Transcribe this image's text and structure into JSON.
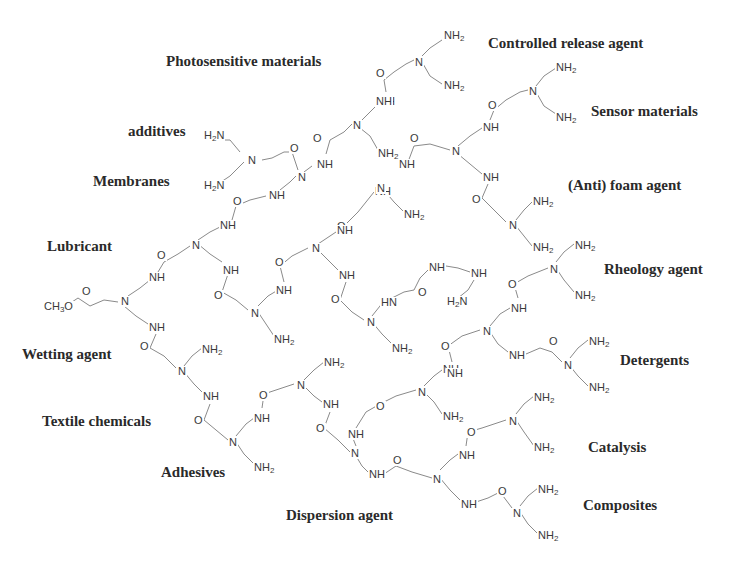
{
  "figure": {
    "type": "dendrimer-structure-diagram",
    "core_group": "CH3O",
    "applications": [
      {
        "id": "photosensitive",
        "label": "Photosensitive materials",
        "x": 166,
        "y": 54
      },
      {
        "id": "controlled-release",
        "label": "Controlled release agent",
        "x": 488,
        "y": 36
      },
      {
        "id": "additives",
        "label": "additives",
        "x": 128,
        "y": 124
      },
      {
        "id": "sensor",
        "label": "Sensor materials",
        "x": 591,
        "y": 104
      },
      {
        "id": "membranes",
        "label": "Membranes",
        "x": 93,
        "y": 174
      },
      {
        "id": "anti-foam",
        "label": "(Anti) foam agent",
        "x": 568,
        "y": 178
      },
      {
        "id": "lubricant",
        "label": "Lubricant",
        "x": 47,
        "y": 239
      },
      {
        "id": "rheology",
        "label": "Rheology agent",
        "x": 604,
        "y": 262
      },
      {
        "id": "wetting",
        "label": "Wetting agent",
        "x": 22,
        "y": 347
      },
      {
        "id": "detergents",
        "label": "Detergents",
        "x": 620,
        "y": 353
      },
      {
        "id": "textile",
        "label": "Textile chemicals",
        "x": 42,
        "y": 414
      },
      {
        "id": "catalysis",
        "label": "Catalysis",
        "x": 588,
        "y": 440
      },
      {
        "id": "adhesives",
        "label": "Adhesives",
        "x": 161,
        "y": 465
      },
      {
        "id": "composites",
        "label": "Composites",
        "x": 583,
        "y": 498
      },
      {
        "id": "dispersion",
        "label": "Dispersion agent",
        "x": 286,
        "y": 508
      }
    ],
    "atoms": [
      {
        "t": "CH3O",
        "x": 43,
        "y": 301
      },
      {
        "t": "O",
        "x": 81,
        "y": 286
      },
      {
        "t": "N",
        "x": 120,
        "y": 296
      },
      {
        "t": "NH",
        "x": 148,
        "y": 272
      },
      {
        "t": "O",
        "x": 156,
        "y": 250
      },
      {
        "t": "N",
        "x": 191,
        "y": 240
      },
      {
        "t": "NH",
        "x": 219,
        "y": 220
      },
      {
        "t": "O",
        "x": 232,
        "y": 196
      },
      {
        "t": "NH",
        "x": 268,
        "y": 190
      },
      {
        "t": "N",
        "x": 297,
        "y": 172
      },
      {
        "t": "O",
        "x": 289,
        "y": 143
      },
      {
        "t": "H2N",
        "x": 203,
        "y": 130
      },
      {
        "t": "N",
        "x": 247,
        "y": 155
      },
      {
        "t": "H2N",
        "x": 203,
        "y": 180
      },
      {
        "t": "NH",
        "x": 316,
        "y": 159
      },
      {
        "t": "O",
        "x": 312,
        "y": 133
      },
      {
        "t": "N",
        "x": 352,
        "y": 120
      },
      {
        "t": "NH",
        "x": 378,
        "y": 96
      },
      {
        "t": "NH2",
        "x": 377,
        "y": 148
      },
      {
        "t": "O",
        "x": 375,
        "y": 68
      },
      {
        "t": "NH",
        "x": 375,
        "y": 96
      },
      {
        "t": "N",
        "x": 414,
        "y": 57
      },
      {
        "t": "NH2",
        "x": 443,
        "y": 30
      },
      {
        "t": "NH2",
        "x": 443,
        "y": 80
      },
      {
        "t": "NH",
        "x": 398,
        "y": 159
      },
      {
        "t": "O",
        "x": 409,
        "y": 133
      },
      {
        "t": "N",
        "x": 451,
        "y": 146
      },
      {
        "t": "NH",
        "x": 482,
        "y": 122
      },
      {
        "t": "O",
        "x": 487,
        "y": 100
      },
      {
        "t": "N",
        "x": 528,
        "y": 86
      },
      {
        "t": "NH2",
        "x": 555,
        "y": 62
      },
      {
        "t": "NH2",
        "x": 555,
        "y": 112
      },
      {
        "t": "NH",
        "x": 482,
        "y": 172
      },
      {
        "t": "O",
        "x": 471,
        "y": 194
      },
      {
        "t": "N",
        "x": 508,
        "y": 220
      },
      {
        "t": "NH2",
        "x": 532,
        "y": 196
      },
      {
        "t": "NH2",
        "x": 532,
        "y": 242
      },
      {
        "t": "NH",
        "x": 374,
        "y": 186
      },
      {
        "t": "N",
        "x": 376,
        "y": 183
      },
      {
        "t": "NH2",
        "x": 403,
        "y": 209
      },
      {
        "t": "O",
        "x": 336,
        "y": 221
      },
      {
        "t": "NH",
        "x": 336,
        "y": 225
      },
      {
        "t": "N",
        "x": 311,
        "y": 243
      },
      {
        "t": "NH",
        "x": 338,
        "y": 270
      },
      {
        "t": "O",
        "x": 330,
        "y": 294
      },
      {
        "t": "N",
        "x": 366,
        "y": 317
      },
      {
        "t": "NH2",
        "x": 391,
        "y": 343
      },
      {
        "t": "HN",
        "x": 380,
        "y": 297
      },
      {
        "t": "O",
        "x": 417,
        "y": 287
      },
      {
        "t": "NH",
        "x": 428,
        "y": 262
      },
      {
        "t": "NH",
        "x": 470,
        "y": 268
      },
      {
        "t": "H2N",
        "x": 446,
        "y": 296
      },
      {
        "t": "O",
        "x": 274,
        "y": 257
      },
      {
        "t": "NH",
        "x": 275,
        "y": 285
      },
      {
        "t": "N",
        "x": 250,
        "y": 308
      },
      {
        "t": "NH2",
        "x": 273,
        "y": 334
      },
      {
        "t": "NH",
        "x": 222,
        "y": 265
      },
      {
        "t": "O",
        "x": 213,
        "y": 290
      },
      {
        "t": "NH",
        "x": 148,
        "y": 322
      },
      {
        "t": "O",
        "x": 139,
        "y": 341
      },
      {
        "t": "N",
        "x": 177,
        "y": 366
      },
      {
        "t": "NH2",
        "x": 201,
        "y": 344
      },
      {
        "t": "NH",
        "x": 202,
        "y": 391
      },
      {
        "t": "O",
        "x": 193,
        "y": 415
      },
      {
        "t": "N",
        "x": 228,
        "y": 437
      },
      {
        "t": "NH2",
        "x": 253,
        "y": 462
      },
      {
        "t": "NH",
        "x": 253,
        "y": 413
      },
      {
        "t": "O",
        "x": 258,
        "y": 390
      },
      {
        "t": "N",
        "x": 296,
        "y": 380
      },
      {
        "t": "NH2",
        "x": 323,
        "y": 357
      },
      {
        "t": "NH",
        "x": 322,
        "y": 399
      },
      {
        "t": "O",
        "x": 315,
        "y": 423
      },
      {
        "t": "N",
        "x": 350,
        "y": 448
      },
      {
        "t": "NH",
        "x": 368,
        "y": 469
      },
      {
        "t": "O",
        "x": 392,
        "y": 455
      },
      {
        "t": "N",
        "x": 432,
        "y": 474
      },
      {
        "t": "NH",
        "x": 458,
        "y": 450
      },
      {
        "t": "O",
        "x": 466,
        "y": 427
      },
      {
        "t": "N",
        "x": 508,
        "y": 416
      },
      {
        "t": "NH2",
        "x": 533,
        "y": 392
      },
      {
        "t": "NH2",
        "x": 533,
        "y": 442
      },
      {
        "t": "NH",
        "x": 460,
        "y": 499
      },
      {
        "t": "O",
        "x": 497,
        "y": 486
      },
      {
        "t": "N",
        "x": 512,
        "y": 508
      },
      {
        "t": "NH2",
        "x": 537,
        "y": 484
      },
      {
        "t": "NH2",
        "x": 537,
        "y": 530
      },
      {
        "t": "NH",
        "x": 347,
        "y": 429
      },
      {
        "t": "O",
        "x": 375,
        "y": 401
      },
      {
        "t": "N",
        "x": 417,
        "y": 387
      },
      {
        "t": "NH",
        "x": 442,
        "y": 364
      },
      {
        "t": "NH2",
        "x": 442,
        "y": 411
      },
      {
        "t": "O",
        "x": 440,
        "y": 341
      },
      {
        "t": "NH",
        "x": 446,
        "y": 368
      },
      {
        "t": "N",
        "x": 482,
        "y": 326
      },
      {
        "t": "NH",
        "x": 510,
        "y": 303
      },
      {
        "t": "O",
        "x": 507,
        "y": 279
      },
      {
        "t": "N",
        "x": 549,
        "y": 264
      },
      {
        "t": "NH2",
        "x": 574,
        "y": 240
      },
      {
        "t": "NH2",
        "x": 574,
        "y": 290
      },
      {
        "t": "NH",
        "x": 508,
        "y": 350
      },
      {
        "t": "O",
        "x": 548,
        "y": 336
      },
      {
        "t": "N",
        "x": 563,
        "y": 360
      },
      {
        "t": "NH2",
        "x": 588,
        "y": 336
      },
      {
        "t": "NH2",
        "x": 588,
        "y": 382
      }
    ]
  }
}
